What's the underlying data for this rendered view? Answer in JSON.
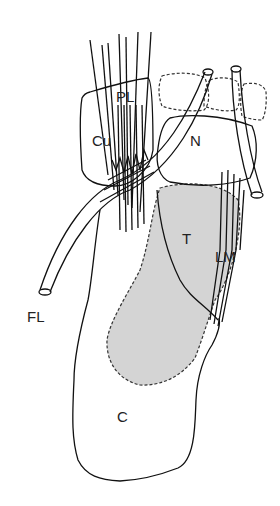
{
  "diagram": {
    "type": "anatomical-line-drawing",
    "labels": {
      "PL": "PL",
      "Cu": "Cu",
      "N": "N",
      "T": "T",
      "LM": "LM",
      "FL": "FL",
      "C": "C"
    },
    "colors": {
      "stroke": "#111111",
      "shade": "#d4d4d4",
      "background": "#ffffff"
    }
  }
}
